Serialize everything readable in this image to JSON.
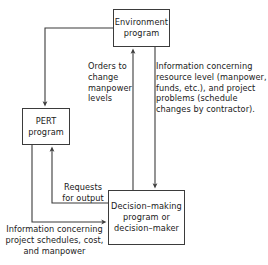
{
  "diagram": {
    "line_color": "#3b3b3b",
    "text_color": "#1a1a1a",
    "background": "#ffffff",
    "nodes": {
      "environment": {
        "line1": "Environment",
        "line2": "program"
      },
      "pert": {
        "line1": "PERT",
        "line2": "program"
      },
      "decision": {
        "line1": "Decision–making",
        "line2": "program or",
        "line3": "decision–maker"
      }
    },
    "captions": {
      "orders": {
        "line1": "Orders to",
        "line2": "change",
        "line3": "manpower",
        "line4": "levels"
      },
      "information_resource": {
        "line1": "Information concerning",
        "line2": "resource level (manpower,",
        "line3": "funds, etc.), and project",
        "line4": "problems (schedule",
        "line5": "changes by contractor)."
      },
      "requests": {
        "line1": "Requests",
        "line2": "for output"
      },
      "information_project": {
        "line1": "Information concerning",
        "line2": "project schedules, cost,",
        "line3": "and manpower"
      }
    },
    "edges": [
      {
        "name": "environment-to-pert",
        "from": "environment",
        "to": "pert",
        "label": "orders-change-manpower-path"
      },
      {
        "name": "decision-to-environment",
        "from": "decision",
        "to": "environment",
        "label": "orders"
      },
      {
        "name": "environment-to-decision",
        "from": "environment",
        "to": "decision",
        "label": "information_resource"
      },
      {
        "name": "decision-to-pert",
        "from": "decision",
        "to": "pert",
        "label": "requests"
      },
      {
        "name": "pert-to-decision",
        "from": "pert",
        "to": "decision",
        "label": "information_project"
      }
    ]
  }
}
